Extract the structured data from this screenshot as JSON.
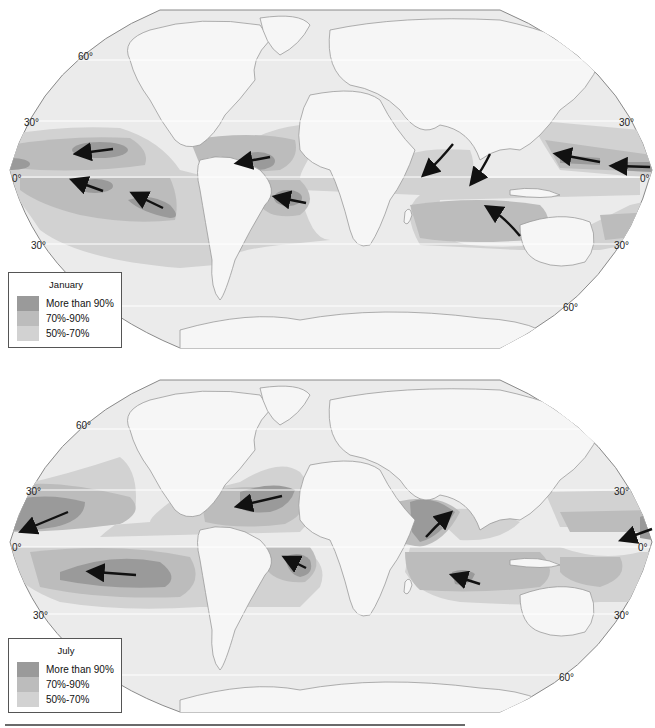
{
  "colors": {
    "ocean": "#ebebeb",
    "land": "#f6f6f6",
    "coast": "#9a9a9a",
    "band_50_70": "#d2d2d2",
    "band_70_90": "#bcbcbc",
    "band_90_plus": "#9a9a9a",
    "arrow": "#111111",
    "gridline": "#ffffff",
    "outline": "#8a8a8a"
  },
  "maps": [
    {
      "id": "january",
      "legend": {
        "title": "January",
        "items": [
          {
            "label": "More than 90%",
            "color": "#9a9a9a"
          },
          {
            "label": "70%-90%",
            "color": "#bcbcbc"
          },
          {
            "label": "50%-70%",
            "color": "#d2d2d2"
          }
        ]
      },
      "lat_labels": [
        {
          "text": "60°",
          "x": 78,
          "y": 57
        },
        {
          "text": "30°",
          "x": 24,
          "y": 118
        },
        {
          "text": "0°",
          "x": 14,
          "y": 174
        },
        {
          "text": "30°",
          "x": 31,
          "y": 240
        },
        {
          "text": "30°",
          "x": 620,
          "y": 118
        },
        {
          "text": "0°",
          "x": 640,
          "y": 174
        },
        {
          "text": "30°",
          "x": 614,
          "y": 240
        },
        {
          "text": "60°",
          "x": 563,
          "y": 302
        }
      ]
    },
    {
      "id": "july",
      "legend": {
        "title": "July",
        "items": [
          {
            "label": "More than 90%",
            "color": "#9a9a9a"
          },
          {
            "label": "70%-90%",
            "color": "#bcbcbc"
          },
          {
            "label": "50%-70%",
            "color": "#d2d2d2"
          }
        ]
      },
      "lat_labels": [
        {
          "text": "60°",
          "x": 76,
          "y": 63
        },
        {
          "text": "30°",
          "x": 26,
          "y": 124
        },
        {
          "text": "0°",
          "x": 12,
          "y": 180
        },
        {
          "text": "30°",
          "x": 33,
          "y": 248
        },
        {
          "text": "30°",
          "x": 614,
          "y": 124
        },
        {
          "text": "0°",
          "x": 638,
          "y": 180
        },
        {
          "text": "30°",
          "x": 614,
          "y": 248
        },
        {
          "text": "60°",
          "x": 559,
          "y": 310
        }
      ]
    }
  ]
}
